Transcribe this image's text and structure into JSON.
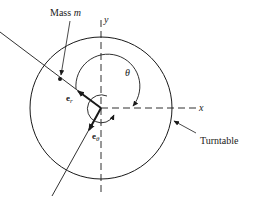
{
  "figure": {
    "labels": {
      "mass": "Mass",
      "mass_symbol": "m",
      "y_axis": "y",
      "x_axis": "x",
      "theta": "θ",
      "e_r_base": "e",
      "e_r_sub": "r",
      "e_theta_base": "e",
      "e_theta_sub": "θ",
      "turntable": "Turntable"
    },
    "colors": {
      "stroke": "#1a1a1a",
      "background": "#ffffff"
    }
  }
}
